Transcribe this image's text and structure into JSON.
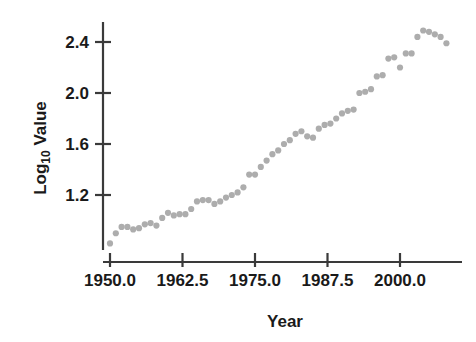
{
  "chart_data": {
    "type": "scatter",
    "title": "",
    "xlabel": "Year",
    "ylabel": "Log10 Value",
    "ylabel_main": "Log",
    "ylabel_sub": "10",
    "ylabel_rest": " Value",
    "xlim": [
      1948.5,
      2009.5
    ],
    "ylim": [
      0.76,
      2.56
    ],
    "grid": false,
    "legend": null,
    "marker_color": "#adadad",
    "axis_color": "#3a3a3a",
    "background": "#ffffff",
    "xticks": [
      1950.0,
      1962.5,
      1975.0,
      1987.5,
      2000.0
    ],
    "xtick_labels": [
      "1950.0",
      "1962.5",
      "1975.0",
      "1987.5",
      "2000.0"
    ],
    "yticks": [
      1.2,
      1.6,
      2.0,
      2.4
    ],
    "ytick_labels": [
      "1.2",
      "1.6",
      "2.0",
      "2.4"
    ],
    "x": [
      1950,
      1951,
      1952,
      1953,
      1954,
      1955,
      1956,
      1957,
      1958,
      1959,
      1960,
      1961,
      1962,
      1963,
      1964,
      1965,
      1966,
      1967,
      1968,
      1969,
      1970,
      1971,
      1972,
      1973,
      1974,
      1975,
      1976,
      1977,
      1978,
      1979,
      1980,
      1981,
      1982,
      1983,
      1984,
      1985,
      1986,
      1987,
      1988,
      1989,
      1990,
      1991,
      1992,
      1993,
      1994,
      1995,
      1996,
      1997,
      1998,
      1999,
      2000,
      2001,
      2002,
      2003,
      2004,
      2005,
      2006,
      2007,
      2008
    ],
    "y": [
      0.82,
      0.9,
      0.95,
      0.95,
      0.93,
      0.94,
      0.97,
      0.98,
      0.96,
      1.02,
      1.06,
      1.04,
      1.05,
      1.05,
      1.09,
      1.15,
      1.16,
      1.16,
      1.13,
      1.15,
      1.18,
      1.2,
      1.22,
      1.26,
      1.36,
      1.36,
      1.42,
      1.47,
      1.52,
      1.55,
      1.6,
      1.63,
      1.68,
      1.7,
      1.66,
      1.65,
      1.72,
      1.75,
      1.76,
      1.8,
      1.84,
      1.86,
      1.87,
      2.0,
      2.01,
      2.03,
      2.13,
      2.14,
      2.27,
      2.28,
      2.2,
      2.31,
      2.31,
      2.44,
      2.49,
      2.48,
      2.46,
      2.44,
      2.39
    ]
  }
}
